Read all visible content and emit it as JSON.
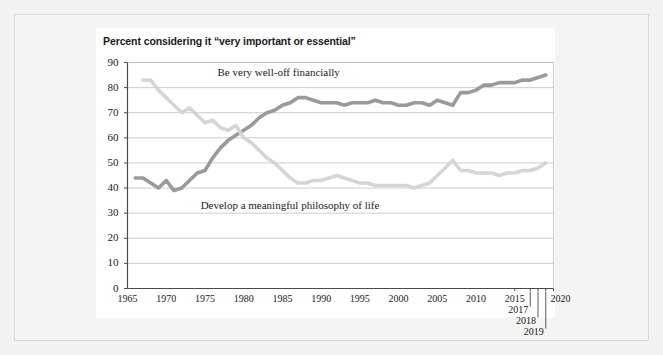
{
  "figure": {
    "title": "Percent considering it “very important or essential”"
  },
  "chart_data": {
    "type": "line",
    "title": "Percent considering it “very important or essential”",
    "xlabel": "",
    "ylabel": "",
    "xlim": [
      1965,
      2020
    ],
    "ylim": [
      0,
      90
    ],
    "grid": true,
    "grid_axis": "y",
    "legend": "inline-annotation",
    "ytick_labels": [
      "0",
      "10",
      "20",
      "30",
      "40",
      "50",
      "60",
      "70",
      "80",
      "90"
    ],
    "ytick_values": [
      0,
      10,
      20,
      30,
      40,
      50,
      60,
      70,
      80,
      90
    ],
    "xtick_labels": [
      "1965",
      "1970",
      "1975",
      "1980",
      "1985",
      "1990",
      "1995",
      "2000",
      "2005",
      "2010",
      "2015",
      "2017",
      "2018",
      "2019",
      "2020"
    ],
    "xtick_values": [
      1965,
      1970,
      1975,
      1980,
      1985,
      1990,
      1995,
      2000,
      2005,
      2010,
      2015,
      2017,
      2018,
      2019,
      2020
    ],
    "colors": {
      "be_very_well_off_financially": "#9a9a9a",
      "develop_a_meaningful_philosophy_of_life": "#d5d5d5"
    },
    "series": [
      {
        "name": "Be very well-off financially",
        "color": "#9a9a9a",
        "label_position": {
          "x": 1984.5,
          "y": 86
        },
        "x": [
          1966,
          1967,
          1968,
          1969,
          1970,
          1971,
          1972,
          1973,
          1974,
          1975,
          1976,
          1977,
          1978,
          1979,
          1980,
          1981,
          1982,
          1983,
          1984,
          1985,
          1986,
          1987,
          1988,
          1989,
          1990,
          1991,
          1992,
          1993,
          1994,
          1995,
          1996,
          1997,
          1998,
          1999,
          2000,
          2001,
          2002,
          2003,
          2004,
          2005,
          2006,
          2007,
          2008,
          2009,
          2010,
          2011,
          2012,
          2013,
          2014,
          2015,
          2016,
          2017,
          2018,
          2019
        ],
        "values": [
          44,
          44,
          42,
          40,
          43,
          39,
          40,
          43,
          46,
          47,
          52,
          56,
          59,
          61,
          63,
          65,
          68,
          70,
          71,
          73,
          74,
          76,
          76,
          75,
          74,
          74,
          74,
          73,
          74,
          74,
          74,
          75,
          74,
          74,
          73,
          73,
          74,
          74,
          73,
          75,
          74,
          73,
          78,
          78,
          79,
          81,
          81,
          82,
          82,
          82,
          83,
          83,
          84,
          85
        ]
      },
      {
        "name": "Develop a meaningful philosophy of life",
        "color": "#d5d5d5",
        "label_position": {
          "x": 1986,
          "y": 33
        },
        "x": [
          1967,
          1968,
          1969,
          1970,
          1971,
          1972,
          1973,
          1974,
          1975,
          1976,
          1977,
          1978,
          1979,
          1980,
          1981,
          1982,
          1983,
          1984,
          1985,
          1986,
          1987,
          1988,
          1989,
          1990,
          1991,
          1992,
          1993,
          1994,
          1995,
          1996,
          1997,
          1998,
          1999,
          2000,
          2001,
          2002,
          2003,
          2004,
          2005,
          2006,
          2007,
          2008,
          2009,
          2010,
          2011,
          2012,
          2013,
          2014,
          2015,
          2016,
          2017,
          2018,
          2019
        ],
        "values": [
          83,
          83,
          79,
          76,
          73,
          70,
          72,
          69,
          66,
          67,
          64,
          63,
          65,
          60,
          58,
          55,
          52,
          50,
          47,
          44,
          42,
          42,
          43,
          43,
          44,
          45,
          44,
          43,
          42,
          42,
          41,
          41,
          41,
          41,
          41,
          40,
          41,
          42,
          45,
          48,
          51,
          47,
          47,
          46,
          46,
          46,
          45,
          46,
          46,
          47,
          47,
          48,
          50
        ]
      }
    ]
  }
}
